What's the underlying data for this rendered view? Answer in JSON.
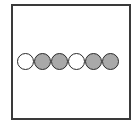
{
  "diagram": {
    "frame": {
      "border_color": "#3a3a3a"
    },
    "beads": [
      {
        "fill": "#ffffff",
        "state": "empty"
      },
      {
        "fill": "#a9a9a9",
        "state": "filled"
      },
      {
        "fill": "#a9a9a9",
        "state": "filled"
      },
      {
        "fill": "#ffffff",
        "state": "empty"
      },
      {
        "fill": "#a9a9a9",
        "state": "filled"
      },
      {
        "fill": "#a9a9a9",
        "state": "filled"
      }
    ]
  }
}
